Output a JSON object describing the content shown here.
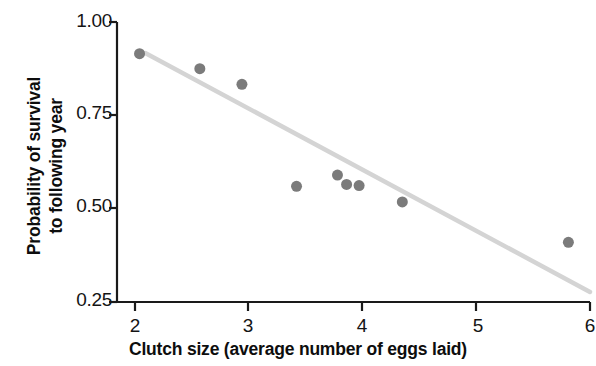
{
  "chart_data": {
    "type": "scatter",
    "title": "",
    "xlabel": "Clutch size (average number of eggs laid)",
    "ylabel_line1": "Probability of survival",
    "ylabel_line2": "to following year",
    "ylabel": "Probability of survival to following year",
    "xlim": [
      2,
      6
    ],
    "ylim": [
      0.25,
      1.0
    ],
    "xticks": [
      2,
      3,
      4,
      5,
      6
    ],
    "xtick_labels": [
      "2",
      "3",
      "4",
      "5",
      "6"
    ],
    "yticks": [
      0.25,
      0.5,
      0.75,
      1.0
    ],
    "ytick_labels": [
      "0.25",
      "0.50",
      "0.75",
      "1.00"
    ],
    "grid": false,
    "legend": "none",
    "x": [
      2.04,
      2.57,
      2.94,
      3.42,
      3.78,
      3.86,
      3.97,
      4.35,
      5.81
    ],
    "y": [
      0.915,
      0.875,
      0.833,
      0.56,
      0.59,
      0.565,
      0.562,
      0.518,
      0.41
    ],
    "points": [
      {
        "x": 2.04,
        "y": 0.915
      },
      {
        "x": 2.57,
        "y": 0.875
      },
      {
        "x": 2.94,
        "y": 0.833
      },
      {
        "x": 3.42,
        "y": 0.56
      },
      {
        "x": 3.78,
        "y": 0.59
      },
      {
        "x": 3.86,
        "y": 0.565
      },
      {
        "x": 3.97,
        "y": 0.562
      },
      {
        "x": 4.35,
        "y": 0.518
      },
      {
        "x": 5.81,
        "y": 0.41
      }
    ],
    "trendline": {
      "type": "line",
      "x": [
        2.09,
        6.0
      ],
      "y": [
        0.917,
        0.277
      ],
      "color": "#d4d4d4"
    },
    "point_color": "#7b7b7b",
    "point_radius": 5.5,
    "axis_color": "#1a1a1a"
  }
}
